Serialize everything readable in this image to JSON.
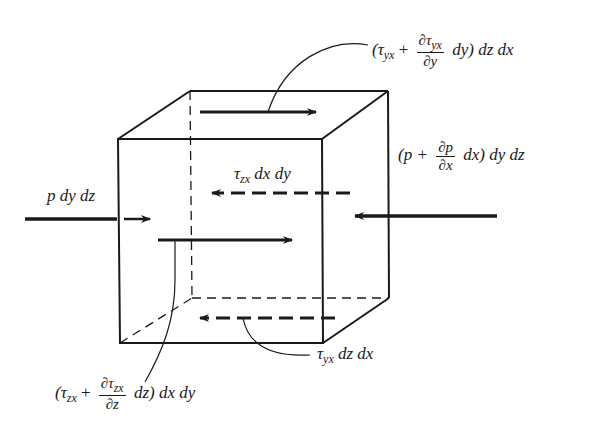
{
  "diagram": {
    "colors": {
      "ink": "#1a1a1a",
      "background": "#ffffff"
    },
    "labels": {
      "top_shear": {
        "open": "(",
        "tau": "τ",
        "sub": "yx",
        "plus": " + ",
        "num_d": "∂τ",
        "num_sub": "yx",
        "den": "∂y",
        "tail": " dy) dz dx"
      },
      "right_pressure": {
        "open": "(p + ",
        "num": "∂p",
        "den": "∂x",
        "tail": " dx) dy dz"
      },
      "left_pressure": {
        "text": "p dy dz"
      },
      "back_shear": {
        "tau": "τ",
        "sub": "zx",
        "tail": " dx dy"
      },
      "bottom_shear": {
        "tau": "τ",
        "sub": "yx",
        "tail": " dz dx"
      },
      "front_shear": {
        "open": "(",
        "tau": "τ",
        "sub": "zx",
        "plus": " + ",
        "num_d": "∂τ",
        "num_sub": "zx",
        "den": "∂z",
        "tail": " dz) dx dy"
      }
    },
    "cube": {
      "front_top_left": [
        118,
        139
      ],
      "front_top_right": [
        322,
        139
      ],
      "front_bottom_left": [
        120,
        343
      ],
      "front_bottom_right": [
        323,
        343
      ],
      "back_top_left": [
        190,
        91
      ],
      "back_top_right": [
        388,
        91
      ],
      "back_bottom_left": [
        192,
        298
      ],
      "back_bottom_right": [
        389,
        298
      ]
    },
    "arrows": [
      {
        "name": "top-shear-arrow",
        "style": "solid",
        "from": [
          200,
          112
        ],
        "to": [
          316,
          112
        ]
      },
      {
        "name": "left-pressure-arrow",
        "style": "solid",
        "from": [
          25,
          219
        ],
        "to": [
          118,
          219
        ]
      },
      {
        "name": "left-pressure-arrow-inner",
        "style": "solid",
        "from": [
          124,
          219
        ],
        "to": [
          150,
          219
        ]
      },
      {
        "name": "right-pressure-arrow",
        "style": "solid",
        "from": [
          497,
          216
        ],
        "to": [
          355,
          216
        ]
      },
      {
        "name": "back-shear-arrow",
        "style": "dashed",
        "from": [
          350,
          193
        ],
        "to": [
          210,
          193
        ]
      },
      {
        "name": "front-shear-arrow",
        "style": "solid",
        "from": [
          158,
          240
        ],
        "to": [
          292,
          240
        ]
      },
      {
        "name": "bottom-shear-arrow",
        "style": "dashed",
        "from": [
          335,
          318
        ],
        "to": [
          198,
          318
        ]
      }
    ]
  }
}
